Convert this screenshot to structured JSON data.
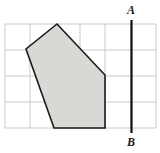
{
  "figure": {
    "title": "",
    "grid": {
      "x_lines": [
        5,
        30,
        55,
        80,
        105,
        131,
        156
      ],
      "y_lines": [
        24,
        50,
        76,
        102,
        128
      ],
      "columns": 6,
      "rows": 4,
      "cell_width": 25,
      "cell_height": 26,
      "line_color": "#c9c9c9",
      "background_color": "#ffffff"
    },
    "shape": {
      "name": "shaded-pentagon",
      "points": "57,24 26,49 54,128 105,128 105,75",
      "vertices": [
        {
          "x": 57,
          "y": 24
        },
        {
          "x": 26,
          "y": 49
        },
        {
          "x": 54,
          "y": 128
        },
        {
          "x": 105,
          "y": 128
        },
        {
          "x": 105,
          "y": 75
        }
      ],
      "fill_color": "#d8d6d2",
      "stroke_color": "#1a1a1a",
      "stroke_width": 1.6
    },
    "mirror_line": {
      "name": "line-AB",
      "x": 131.5,
      "y_top": 20,
      "y_bottom": 133,
      "color": "#111111",
      "width": 2.2,
      "top_label": "A",
      "bottom_label": "B"
    }
  }
}
